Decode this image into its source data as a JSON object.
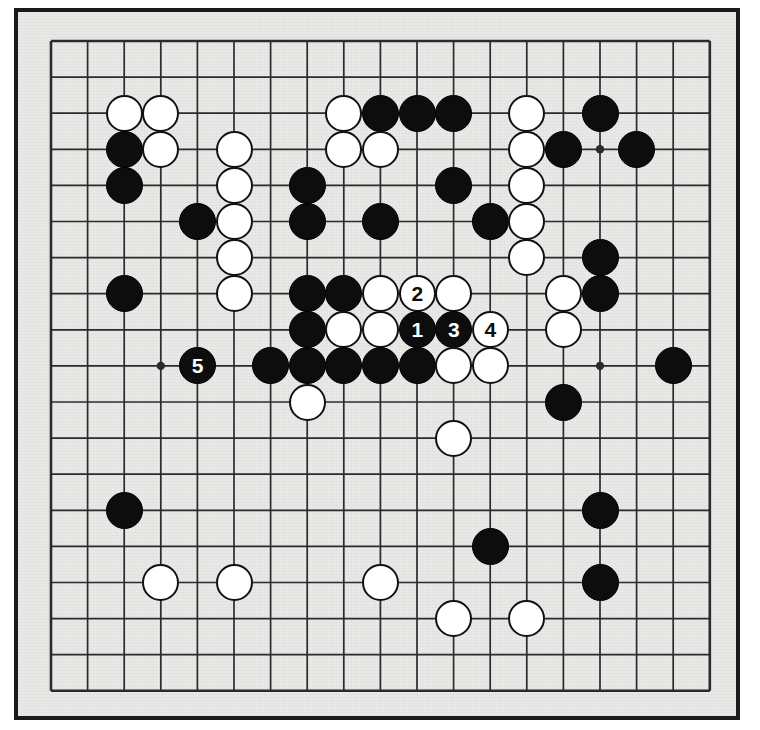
{
  "diagram": {
    "type": "go-board-diagram",
    "board_size": 19,
    "background_color": "#e9e9e7",
    "line_color": "#2b2b2b",
    "frame_color": "#1a1a1a",
    "black_color": "#0d0d0d",
    "white_color": "#ffffff",
    "star_points": [
      [
        3,
        3
      ],
      [
        9,
        3
      ],
      [
        15,
        3
      ],
      [
        3,
        9
      ],
      [
        9,
        9
      ],
      [
        15,
        9
      ],
      [
        3,
        15
      ],
      [
        9,
        15
      ],
      [
        15,
        15
      ]
    ],
    "geometry": {
      "origin_x": 33,
      "origin_y": 29,
      "spacing_x": 36.6,
      "spacing_y": 36.1,
      "stone_radius": 18.5
    },
    "stones": [
      {
        "color": "white",
        "col": 2,
        "row": 2,
        "label": ""
      },
      {
        "color": "white",
        "col": 3,
        "row": 2,
        "label": ""
      },
      {
        "color": "black",
        "col": 2,
        "row": 3,
        "label": ""
      },
      {
        "color": "white",
        "col": 3,
        "row": 3,
        "label": ""
      },
      {
        "color": "black",
        "col": 2,
        "row": 4,
        "label": ""
      },
      {
        "color": "white",
        "col": 5,
        "row": 3,
        "label": ""
      },
      {
        "color": "white",
        "col": 5,
        "row": 4,
        "label": ""
      },
      {
        "color": "black",
        "col": 4,
        "row": 5,
        "label": ""
      },
      {
        "color": "white",
        "col": 5,
        "row": 5,
        "label": ""
      },
      {
        "color": "white",
        "col": 5,
        "row": 6,
        "label": ""
      },
      {
        "color": "white",
        "col": 5,
        "row": 7,
        "label": ""
      },
      {
        "color": "black",
        "col": 2,
        "row": 7,
        "label": ""
      },
      {
        "color": "white",
        "col": 8,
        "row": 2,
        "label": ""
      },
      {
        "color": "black",
        "col": 9,
        "row": 2,
        "label": ""
      },
      {
        "color": "black",
        "col": 10,
        "row": 2,
        "label": ""
      },
      {
        "color": "black",
        "col": 11,
        "row": 2,
        "label": ""
      },
      {
        "color": "white",
        "col": 8,
        "row": 3,
        "label": ""
      },
      {
        "color": "white",
        "col": 9,
        "row": 3,
        "label": ""
      },
      {
        "color": "black",
        "col": 7,
        "row": 4,
        "label": ""
      },
      {
        "color": "black",
        "col": 11,
        "row": 4,
        "label": ""
      },
      {
        "color": "black",
        "col": 7,
        "row": 5,
        "label": ""
      },
      {
        "color": "black",
        "col": 9,
        "row": 5,
        "label": ""
      },
      {
        "color": "black",
        "col": 12,
        "row": 5,
        "label": ""
      },
      {
        "color": "white",
        "col": 13,
        "row": 2,
        "label": ""
      },
      {
        "color": "black",
        "col": 15,
        "row": 2,
        "label": ""
      },
      {
        "color": "white",
        "col": 13,
        "row": 3,
        "label": ""
      },
      {
        "color": "black",
        "col": 14,
        "row": 3,
        "label": ""
      },
      {
        "color": "black",
        "col": 16,
        "row": 3,
        "label": ""
      },
      {
        "color": "white",
        "col": 13,
        "row": 4,
        "label": ""
      },
      {
        "color": "white",
        "col": 13,
        "row": 5,
        "label": ""
      },
      {
        "color": "white",
        "col": 13,
        "row": 6,
        "label": ""
      },
      {
        "color": "black",
        "col": 15,
        "row": 6,
        "label": ""
      },
      {
        "color": "black",
        "col": 15,
        "row": 7,
        "label": ""
      },
      {
        "color": "black",
        "col": 7,
        "row": 7,
        "label": ""
      },
      {
        "color": "black",
        "col": 8,
        "row": 7,
        "label": ""
      },
      {
        "color": "white",
        "col": 9,
        "row": 7,
        "label": ""
      },
      {
        "color": "white",
        "col": 10,
        "row": 7,
        "label": "2"
      },
      {
        "color": "white",
        "col": 11,
        "row": 7,
        "label": ""
      },
      {
        "color": "white",
        "col": 14,
        "row": 7,
        "label": ""
      },
      {
        "color": "black",
        "col": 7,
        "row": 8,
        "label": ""
      },
      {
        "color": "white",
        "col": 8,
        "row": 8,
        "label": ""
      },
      {
        "color": "white",
        "col": 9,
        "row": 8,
        "label": ""
      },
      {
        "color": "black",
        "col": 10,
        "row": 8,
        "label": "1"
      },
      {
        "color": "black",
        "col": 11,
        "row": 8,
        "label": "3"
      },
      {
        "color": "white",
        "col": 12,
        "row": 8,
        "label": "4"
      },
      {
        "color": "white",
        "col": 14,
        "row": 8,
        "label": ""
      },
      {
        "color": "black",
        "col": 4,
        "row": 9,
        "label": "5"
      },
      {
        "color": "black",
        "col": 6,
        "row": 9,
        "label": ""
      },
      {
        "color": "black",
        "col": 7,
        "row": 9,
        "label": ""
      },
      {
        "color": "black",
        "col": 8,
        "row": 9,
        "label": ""
      },
      {
        "color": "black",
        "col": 9,
        "row": 9,
        "label": ""
      },
      {
        "color": "black",
        "col": 10,
        "row": 9,
        "label": ""
      },
      {
        "color": "white",
        "col": 11,
        "row": 9,
        "label": ""
      },
      {
        "color": "white",
        "col": 12,
        "row": 9,
        "label": ""
      },
      {
        "color": "black",
        "col": 17,
        "row": 9,
        "label": ""
      },
      {
        "color": "white",
        "col": 7,
        "row": 10,
        "label": ""
      },
      {
        "color": "black",
        "col": 14,
        "row": 10,
        "label": ""
      },
      {
        "color": "white",
        "col": 11,
        "row": 11,
        "label": ""
      },
      {
        "color": "black",
        "col": 2,
        "row": 13,
        "label": ""
      },
      {
        "color": "black",
        "col": 15,
        "row": 13,
        "label": ""
      },
      {
        "color": "black",
        "col": 12,
        "row": 14,
        "label": ""
      },
      {
        "color": "white",
        "col": 3,
        "row": 15,
        "label": ""
      },
      {
        "color": "white",
        "col": 5,
        "row": 15,
        "label": ""
      },
      {
        "color": "white",
        "col": 9,
        "row": 15,
        "label": ""
      },
      {
        "color": "black",
        "col": 15,
        "row": 15,
        "label": ""
      },
      {
        "color": "white",
        "col": 11,
        "row": 16,
        "label": ""
      },
      {
        "color": "white",
        "col": 13,
        "row": 16,
        "label": ""
      }
    ],
    "move_sequence": [
      {
        "number": "1",
        "color": "black",
        "col": 10,
        "row": 8
      },
      {
        "number": "2",
        "color": "white",
        "col": 10,
        "row": 7
      },
      {
        "number": "3",
        "color": "black",
        "col": 11,
        "row": 8
      },
      {
        "number": "4",
        "color": "white",
        "col": 12,
        "row": 8
      },
      {
        "number": "5",
        "color": "black",
        "col": 4,
        "row": 9
      }
    ]
  }
}
